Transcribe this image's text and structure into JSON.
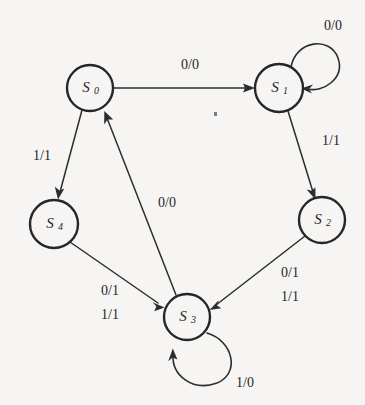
{
  "figure": {
    "type": "state-transition-diagram",
    "title": "",
    "background_color": "#f6f5f3",
    "stroke_color": "#2d2d2d",
    "states": [
      {
        "id": "S0",
        "name": "S",
        "subscript": "0",
        "cx": 90,
        "cy": 88,
        "r": 23
      },
      {
        "id": "S1",
        "name": "S",
        "subscript": "1",
        "cx": 279,
        "cy": 88,
        "r": 24
      },
      {
        "id": "S2",
        "name": "S",
        "subscript": "2",
        "cx": 322,
        "cy": 220,
        "r": 23
      },
      {
        "id": "S3",
        "name": "S",
        "subscript": "3",
        "cx": 187,
        "cy": 317,
        "r": 23
      },
      {
        "id": "S4",
        "name": "S",
        "subscript": "4",
        "cx": 54,
        "cy": 224,
        "r": 24
      }
    ],
    "transitions": [
      {
        "from": "S0",
        "to": "S1",
        "label": "0/0",
        "label_x": 190,
        "label_y": 66,
        "kind": "straight"
      },
      {
        "from": "S1",
        "to": "S1",
        "label": "0/0",
        "label_x": 333,
        "label_y": 27,
        "kind": "self-loop"
      },
      {
        "from": "S1",
        "to": "S2",
        "label": "1/1",
        "label_x": 331,
        "label_y": 142,
        "kind": "straight"
      },
      {
        "from": "S2",
        "to": "S3",
        "label": "0/1\n1/1",
        "label_x": 290,
        "label_y": 280,
        "kind": "straight"
      },
      {
        "from": "S3",
        "to": "S3",
        "label": "1/0",
        "label_x": 245,
        "label_y": 384,
        "kind": "self-loop"
      },
      {
        "from": "S4",
        "to": "S3",
        "label": "0/1\n1/1",
        "label_x": 110,
        "label_y": 298,
        "kind": "straight"
      },
      {
        "from": "S0",
        "to": "S4",
        "label": "1/1",
        "label_x": 42,
        "label_y": 157,
        "kind": "straight"
      },
      {
        "from": "S3",
        "to": "S0",
        "label": "0/0",
        "label_x": 167,
        "label_y": 204,
        "kind": "straight"
      }
    ],
    "edge_labels": {
      "s0_to_s1": "0/0",
      "s1_self": "0/0",
      "s1_to_s2": "1/1",
      "s2_to_s3_line1": "0/1",
      "s2_to_s3_line2": "1/1",
      "s3_self": "1/0",
      "s4_to_s3_line1": "0/1",
      "s4_to_s3_line2": "1/1",
      "s0_to_s4": "1/1",
      "s3_to_s0": "0/0"
    },
    "state_labels": {
      "s0_main": "S",
      "s0_sub": "0",
      "s1_main": "S",
      "s1_sub": "1",
      "s2_main": "S",
      "s2_sub": "2",
      "s3_main": "S",
      "s3_sub": "3",
      "s4_main": "S",
      "s4_sub": "4"
    }
  }
}
